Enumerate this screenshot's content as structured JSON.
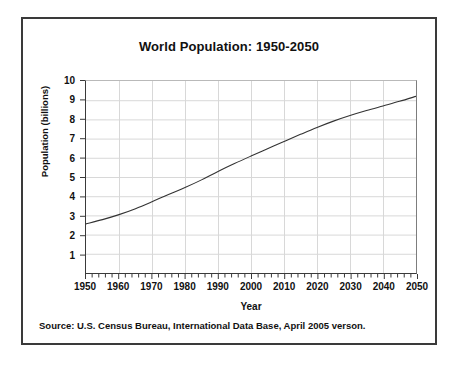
{
  "figure": {
    "title": "World Population: 1950-2050",
    "source_note": "Source: U.S. Census Bureau, International Data Base, April 2005 verson.",
    "frame_color": "#3a3a3a",
    "background": "#ffffff",
    "grid_color": "#d8d8d8",
    "line_color": "#333333"
  },
  "chart_data": {
    "type": "line",
    "title": "World Population: 1950-2050",
    "xlabel": "Year",
    "ylabel": "Population (billions)",
    "xlim": [
      1950,
      2050
    ],
    "ylim": [
      0,
      10
    ],
    "grid": true,
    "legend": "none",
    "x_ticks": [
      1950,
      1960,
      1970,
      1980,
      1990,
      2000,
      2010,
      2020,
      2030,
      2040,
      2050
    ],
    "y_ticks": [
      1,
      2,
      3,
      4,
      5,
      6,
      7,
      8,
      9,
      10
    ],
    "x_minor_tick_interval": 2,
    "series": [
      {
        "name": "World Population",
        "x": [
          1950,
          1955,
          1960,
          1965,
          1970,
          1975,
          1980,
          1985,
          1990,
          1995,
          2000,
          2005,
          2010,
          2015,
          2020,
          2025,
          2030,
          2035,
          2040,
          2045,
          2050
        ],
        "values": [
          2.56,
          2.78,
          3.04,
          3.35,
          3.71,
          4.09,
          4.45,
          4.85,
          5.29,
          5.7,
          6.09,
          6.47,
          6.85,
          7.22,
          7.58,
          7.91,
          8.2,
          8.46,
          8.7,
          8.94,
          9.2
        ]
      }
    ]
  },
  "axes": {
    "y_tick_labels": [
      "10",
      "9",
      "8",
      "7",
      "6",
      "5",
      "4",
      "3",
      "2",
      "1"
    ],
    "x_tick_labels": [
      "1950",
      "1960",
      "1970",
      "1980",
      "1990",
      "2000",
      "2010",
      "2020",
      "2030",
      "2040",
      "2050"
    ],
    "y_title": "Population (billions)",
    "x_title": "Year"
  }
}
